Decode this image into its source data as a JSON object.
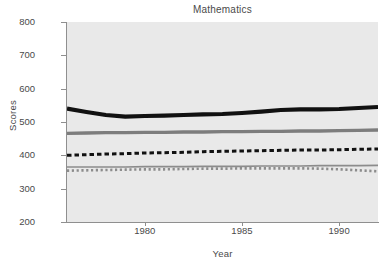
{
  "chart_data": {
    "type": "line",
    "title": "Mathematics",
    "xlabel": "Year",
    "ylabel": "Scores",
    "xlim": [
      1976,
      1992
    ],
    "ylim": [
      200,
      800
    ],
    "yticks": [
      200,
      300,
      400,
      500,
      600,
      700,
      800
    ],
    "xticks": [
      1980,
      1985,
      1990
    ],
    "grid": false,
    "legend": "none",
    "x": [
      1976,
      1977,
      1978,
      1979,
      1980,
      1981,
      1982,
      1983,
      1984,
      1985,
      1986,
      1987,
      1988,
      1989,
      1990,
      1991,
      1992
    ],
    "series": [
      {
        "name": "series-1-black-thick",
        "style": "solid",
        "color": "#111111",
        "width": 4.2,
        "values": [
          540,
          530,
          521,
          516,
          518,
          519,
          521,
          523,
          524,
          527,
          531,
          536,
          538,
          538,
          539,
          542,
          545
        ]
      },
      {
        "name": "series-2-gray-thick",
        "style": "solid",
        "color": "#7d7d7d",
        "width": 3.4,
        "values": [
          466,
          467,
          468,
          468,
          469,
          469,
          470,
          470,
          471,
          471,
          472,
          472,
          473,
          473,
          474,
          475,
          476
        ]
      },
      {
        "name": "series-3-black-dashed",
        "style": "dashed",
        "color": "#111111",
        "width": 3.0,
        "values": [
          400,
          402,
          404,
          405,
          407,
          408,
          409,
          411,
          412,
          413,
          414,
          415,
          416,
          416,
          417,
          418,
          419
        ]
      },
      {
        "name": "series-4-gray-thin",
        "style": "solid",
        "color": "#8c8c8c",
        "width": 1.6,
        "values": [
          365,
          365,
          365,
          365,
          366,
          366,
          366,
          367,
          367,
          367,
          368,
          368,
          368,
          369,
          369,
          369,
          370
        ]
      },
      {
        "name": "series-5-gray-dotted",
        "style": "dotted",
        "color": "#8c8c8c",
        "width": 2.6,
        "values": [
          354,
          355,
          356,
          357,
          358,
          358,
          359,
          360,
          360,
          361,
          361,
          361,
          361,
          360,
          358,
          355,
          352
        ]
      }
    ]
  },
  "axes": {
    "ytick_labels": [
      "800",
      "700",
      "600",
      "500",
      "400",
      "300",
      "200"
    ],
    "xtick_labels": [
      "1980",
      "1985",
      "1990"
    ]
  },
  "colors": {
    "plot_background": "#e9e9e9",
    "axis": "#8f8f8f",
    "text": "#4a4a4a"
  }
}
